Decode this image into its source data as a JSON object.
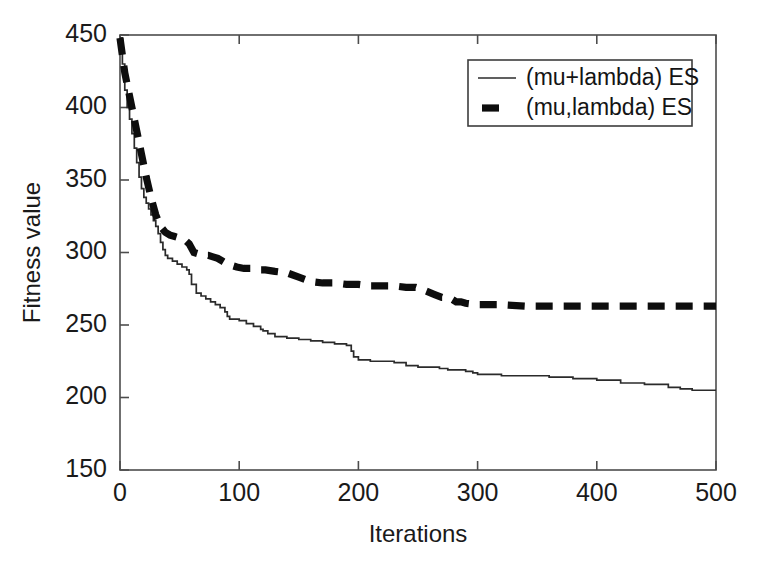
{
  "figure": {
    "background_color": "#ffffff",
    "frame_color": "#4d4d4d",
    "axis_text_color": "#1a1a1a"
  },
  "chart_data": {
    "type": "line",
    "title": "",
    "subtitle": "",
    "xlabel": "Iterations",
    "ylabel": "Fitness value",
    "xlim": [
      0,
      500
    ],
    "ylim": [
      150,
      450
    ],
    "xticks": [
      0,
      100,
      200,
      300,
      400,
      500
    ],
    "yticks": [
      150,
      200,
      250,
      300,
      350,
      400,
      450
    ],
    "xtick_labels": [
      "0",
      "100",
      "200",
      "300",
      "400",
      "500"
    ],
    "ytick_labels": [
      "150",
      "200",
      "250",
      "300",
      "350",
      "400",
      "450"
    ],
    "grid": false,
    "legend_position": "upper right",
    "legend_entries": [
      "(mu+lambda) ES",
      "(mu,lambda) ES"
    ],
    "series": [
      {
        "name": "(mu+lambda) ES",
        "style": "solid",
        "width_px": 1.7,
        "color": "#2b2b2b",
        "x": [
          0,
          2,
          4,
          6,
          8,
          10,
          12,
          14,
          16,
          18,
          20,
          22,
          24,
          26,
          28,
          30,
          32,
          34,
          36,
          38,
          40,
          44,
          48,
          52,
          56,
          58,
          60,
          64,
          68,
          72,
          76,
          80,
          84,
          88,
          90,
          92,
          94,
          96,
          100,
          106,
          112,
          118,
          120,
          124,
          130,
          140,
          150,
          160,
          170,
          180,
          190,
          194,
          196,
          200,
          210,
          220,
          228,
          230,
          240,
          250,
          252,
          260,
          266,
          268,
          275,
          280,
          285,
          290,
          296,
          298,
          300,
          320,
          340,
          360,
          380,
          400,
          420,
          440,
          460,
          470,
          478,
          480,
          490,
          500
        ],
        "y": [
          448,
          430,
          412,
          400,
          392,
          382,
          372,
          362,
          352,
          344,
          338,
          334,
          330,
          326,
          322,
          318,
          313,
          307,
          302,
          298,
          296,
          294,
          292,
          290,
          288,
          285,
          278,
          272,
          270,
          268,
          266,
          264,
          262,
          259,
          256,
          254,
          254,
          254,
          253,
          251,
          249,
          247,
          246,
          244,
          242,
          241,
          240,
          239,
          238,
          237,
          236,
          232,
          228,
          226,
          225,
          225,
          225,
          224,
          222,
          221,
          221,
          221,
          221,
          220,
          219,
          219,
          219,
          218,
          217,
          217,
          216,
          215,
          215,
          214,
          213,
          212,
          210,
          209,
          207,
          206,
          206,
          205,
          205,
          205
        ]
      },
      {
        "name": "(mu,lambda) ES",
        "style": "dashed",
        "width_px": 7.2,
        "color": "#0d0d0d",
        "x": [
          0,
          2,
          4,
          6,
          8,
          10,
          12,
          14,
          16,
          18,
          20,
          22,
          24,
          26,
          28,
          30,
          34,
          38,
          42,
          46,
          50,
          54,
          58,
          62,
          66,
          70,
          74,
          78,
          82,
          86,
          90,
          94,
          98,
          104,
          110,
          116,
          122,
          130,
          140,
          150,
          160,
          170,
          180,
          190,
          200,
          210,
          220,
          230,
          240,
          248,
          252,
          258,
          264,
          270,
          275,
          278,
          282,
          286,
          290,
          300,
          320,
          340,
          360,
          380,
          400,
          420,
          440,
          460,
          480,
          500
        ],
        "y": [
          448,
          436,
          424,
          416,
          408,
          400,
          392,
          384,
          376,
          368,
          360,
          352,
          345,
          338,
          332,
          326,
          318,
          314,
          312,
          311,
          310,
          309,
          306,
          300,
          299,
          298,
          298,
          297,
          296,
          294,
          292,
          291,
          290,
          289,
          289,
          288,
          288,
          287,
          286,
          283,
          280,
          279,
          279,
          278,
          278,
          277,
          277,
          277,
          276,
          276,
          275,
          273,
          271,
          269,
          269,
          268,
          266,
          266,
          265,
          264,
          264,
          263,
          263,
          263,
          263,
          263,
          263,
          263,
          263,
          263
        ]
      }
    ]
  }
}
